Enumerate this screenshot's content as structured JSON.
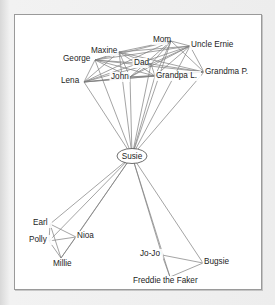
{
  "figure": {
    "title": "",
    "type": "ego-network-diagram",
    "ego": "Susie",
    "colors": {
      "panel_background": "#ffffff",
      "outer_background": "#ededed",
      "panel_border": "#9a9a9a",
      "edge": "#7c7c7c",
      "label_text": "#1d1d1d",
      "ego_node_stroke": "#4a4a4a"
    }
  },
  "chart_data": {
    "type": "network",
    "title": "",
    "xlabel": "",
    "ylabel": "",
    "ego": "Susie",
    "nodes": [
      {
        "id": "george",
        "label": "George",
        "x": 48,
        "y": 44,
        "anchor_x": 80,
        "anchor_y": 45,
        "text_anchor": "start",
        "group": "family-top"
      },
      {
        "id": "maxine",
        "label": "Maxine",
        "x": 76,
        "y": 36,
        "anchor_x": 104,
        "anchor_y": 37,
        "text_anchor": "start",
        "group": "family-top"
      },
      {
        "id": "mom",
        "label": "Mom",
        "x": 138,
        "y": 25,
        "anchor_x": 156,
        "anchor_y": 26,
        "text_anchor": "start",
        "group": "family-top"
      },
      {
        "id": "uncle",
        "label": "Uncle Ernie",
        "x": 176,
        "y": 30,
        "anchor_x": 175,
        "anchor_y": 31,
        "text_anchor": "start",
        "group": "family-top"
      },
      {
        "id": "dad",
        "label": "Dad",
        "x": 119,
        "y": 48,
        "anchor_x": 136,
        "anchor_y": 49,
        "text_anchor": "start",
        "group": "family-top"
      },
      {
        "id": "grandpa",
        "label": "Grandpa L.",
        "x": 141,
        "y": 61,
        "anchor_x": 140,
        "anchor_y": 61,
        "text_anchor": "start",
        "group": "family-top"
      },
      {
        "id": "grandma",
        "label": "Grandma P.",
        "x": 190,
        "y": 57,
        "anchor_x": 189,
        "anchor_y": 57,
        "text_anchor": "start",
        "group": "family-top"
      },
      {
        "id": "john",
        "label": "John",
        "x": 96,
        "y": 62,
        "anchor_x": 115,
        "anchor_y": 62,
        "text_anchor": "start",
        "group": "family-top"
      },
      {
        "id": "lena",
        "label": "Lena",
        "x": 46,
        "y": 66,
        "anchor_x": 69,
        "anchor_y": 67,
        "text_anchor": "start",
        "group": "family-top"
      },
      {
        "id": "susie",
        "label": "Susie",
        "x": 117,
        "y": 141,
        "anchor_x": 117,
        "anchor_y": 141,
        "text_anchor": "middle",
        "group": "ego"
      },
      {
        "id": "earl",
        "label": "Earl",
        "x": 18,
        "y": 208,
        "anchor_x": 35,
        "anchor_y": 209,
        "text_anchor": "start",
        "group": "friends-left"
      },
      {
        "id": "polly",
        "label": "Polly",
        "x": 14,
        "y": 225,
        "anchor_x": 34,
        "anchor_y": 226,
        "text_anchor": "start",
        "group": "friends-left"
      },
      {
        "id": "nioa",
        "label": "Nioa",
        "x": 62,
        "y": 221,
        "anchor_x": 61,
        "anchor_y": 222,
        "text_anchor": "start",
        "group": "friends-left"
      },
      {
        "id": "millie",
        "label": "Millie",
        "x": 38,
        "y": 249,
        "anchor_x": 46,
        "anchor_y": 243,
        "text_anchor": "start",
        "group": "friends-left"
      },
      {
        "id": "jojo",
        "label": "Jo-Jo",
        "x": 125,
        "y": 239,
        "anchor_x": 147,
        "anchor_y": 240,
        "text_anchor": "start",
        "group": "friends-right"
      },
      {
        "id": "bugsie",
        "label": "Bugsie",
        "x": 189,
        "y": 247,
        "anchor_x": 188,
        "anchor_y": 248,
        "text_anchor": "start",
        "group": "friends-right"
      },
      {
        "id": "freddie",
        "label": "Freddie the Faker",
        "x": 118,
        "y": 266,
        "anchor_x": 155,
        "anchor_y": 262,
        "text_anchor": "start",
        "group": "friends-right"
      }
    ],
    "edges": [
      [
        "susie",
        "george"
      ],
      [
        "susie",
        "maxine"
      ],
      [
        "susie",
        "mom"
      ],
      [
        "susie",
        "uncle"
      ],
      [
        "susie",
        "dad"
      ],
      [
        "susie",
        "grandpa"
      ],
      [
        "susie",
        "grandma"
      ],
      [
        "susie",
        "john"
      ],
      [
        "susie",
        "lena"
      ],
      [
        "susie",
        "earl"
      ],
      [
        "susie",
        "polly"
      ],
      [
        "susie",
        "nioa"
      ],
      [
        "susie",
        "millie"
      ],
      [
        "susie",
        "jojo"
      ],
      [
        "susie",
        "bugsie"
      ],
      [
        "susie",
        "freddie"
      ],
      [
        "george",
        "maxine"
      ],
      [
        "george",
        "mom"
      ],
      [
        "george",
        "dad"
      ],
      [
        "george",
        "john"
      ],
      [
        "george",
        "lena"
      ],
      [
        "george",
        "grandpa"
      ],
      [
        "george",
        "grandma"
      ],
      [
        "george",
        "uncle"
      ],
      [
        "maxine",
        "mom"
      ],
      [
        "maxine",
        "dad"
      ],
      [
        "maxine",
        "john"
      ],
      [
        "maxine",
        "lena"
      ],
      [
        "maxine",
        "grandpa"
      ],
      [
        "maxine",
        "grandma"
      ],
      [
        "maxine",
        "uncle"
      ],
      [
        "mom",
        "dad"
      ],
      [
        "mom",
        "john"
      ],
      [
        "mom",
        "lena"
      ],
      [
        "mom",
        "grandpa"
      ],
      [
        "mom",
        "grandma"
      ],
      [
        "mom",
        "uncle"
      ],
      [
        "dad",
        "john"
      ],
      [
        "dad",
        "lena"
      ],
      [
        "dad",
        "grandpa"
      ],
      [
        "dad",
        "grandma"
      ],
      [
        "dad",
        "uncle"
      ],
      [
        "john",
        "lena"
      ],
      [
        "john",
        "grandpa"
      ],
      [
        "john",
        "grandma"
      ],
      [
        "john",
        "uncle"
      ],
      [
        "lena",
        "grandpa"
      ],
      [
        "lena",
        "grandma"
      ],
      [
        "lena",
        "uncle"
      ],
      [
        "grandpa",
        "grandma"
      ],
      [
        "grandpa",
        "uncle"
      ],
      [
        "grandma",
        "uncle"
      ],
      [
        "earl",
        "polly"
      ],
      [
        "earl",
        "nioa"
      ],
      [
        "earl",
        "millie"
      ],
      [
        "polly",
        "nioa"
      ],
      [
        "polly",
        "millie"
      ],
      [
        "nioa",
        "millie"
      ],
      [
        "jojo",
        "bugsie"
      ],
      [
        "jojo",
        "freddie"
      ],
      [
        "bugsie",
        "freddie"
      ]
    ],
    "legend": [],
    "grid": false
  }
}
